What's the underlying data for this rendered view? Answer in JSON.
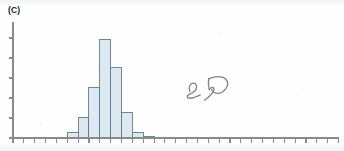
{
  "figure": {
    "panel_label": "(C)",
    "handwritten_annotation": "25",
    "handwritten_rotation_deg": -90
  },
  "colors": {
    "bar_fill": "#dce9f0",
    "bar_stroke": "#5b7d8f",
    "axis": "#8a8a8a",
    "label_text": "#1d1d1d",
    "annotation_ink": "#7c7c7c",
    "background": "#fefefe"
  },
  "chart_data": {
    "type": "bar",
    "title": "(C)",
    "xlabel": "",
    "ylabel": "",
    "grid": false,
    "legend": false,
    "bin_width": 1,
    "x_axis": {
      "tick_count": 30,
      "tick_labels": [],
      "range": [
        0,
        30
      ],
      "origin_px": 13,
      "tick_spacing_px": 10.85
    },
    "y_axis": {
      "tick_count": 6,
      "tick_labels": [],
      "range": [
        0,
        6
      ],
      "tick_spacing_px": 20
    },
    "categories": [
      0,
      1,
      2,
      3,
      4,
      5,
      6,
      7,
      8,
      9,
      10,
      11,
      12,
      13,
      14,
      15,
      16,
      17,
      18,
      19,
      20,
      21,
      22,
      23,
      24,
      25,
      26,
      27,
      28,
      29
    ],
    "values": [
      0,
      0,
      0,
      0,
      0,
      0.3,
      1.05,
      2.55,
      4.95,
      3.55,
      1.3,
      0.3,
      0.1,
      0,
      0,
      0,
      0,
      0,
      0,
      0,
      0,
      0,
      0,
      0,
      0,
      0,
      0,
      0,
      0,
      0
    ],
    "bars": [
      {
        "bin": 5,
        "height": 0.3
      },
      {
        "bin": 6,
        "height": 1.05
      },
      {
        "bin": 7,
        "height": 2.55
      },
      {
        "bin": 8,
        "height": 4.95
      },
      {
        "bin": 9,
        "height": 3.55
      },
      {
        "bin": 10,
        "height": 1.3
      },
      {
        "bin": 11,
        "height": 0.3
      },
      {
        "bin": 12,
        "height": 0.1
      }
    ]
  }
}
